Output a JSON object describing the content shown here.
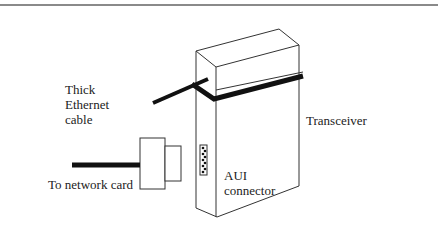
{
  "figure": {
    "type": "diagram",
    "colors": {
      "rule": "#8a8a8a",
      "line": "#333333",
      "cable": "#111111",
      "background": "#ffffff"
    }
  },
  "labels": {
    "thick_cable": [
      "Thick",
      "Ethernet",
      "cable"
    ],
    "transceiver": "Transceiver",
    "aui_connector": [
      "AUI",
      "connector"
    ],
    "to_network_card": "To network card"
  }
}
